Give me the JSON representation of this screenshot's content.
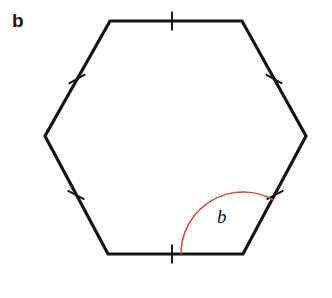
{
  "figure": {
    "part_label": "b",
    "angle_label": "b",
    "background_color": "#ffffff",
    "stroke_color": "#141414",
    "arc_color": "#c8503f",
    "shape_name": "hexagon",
    "stroke_width": 3.2,
    "tick_count": 6,
    "vertices": [
      {
        "name": "top-left",
        "x": 110,
        "y": 21
      },
      {
        "name": "top-right",
        "x": 242,
        "y": 21
      },
      {
        "name": "right",
        "x": 306,
        "y": 136
      },
      {
        "name": "bottom-right",
        "x": 243,
        "y": 254
      },
      {
        "name": "bottom-left",
        "x": 108,
        "y": 254
      },
      {
        "name": "left",
        "x": 45,
        "y": 136
      }
    ],
    "tick_marks": [
      {
        "name": "tick-top",
        "cx": 172,
        "cy": 21,
        "angle_deg": 0
      },
      {
        "name": "tick-upper-right",
        "cx": 274,
        "cy": 79,
        "angle_deg": 61
      },
      {
        "name": "tick-lower-right",
        "cx": 275,
        "cy": 195,
        "angle_deg": -62
      },
      {
        "name": "tick-bottom",
        "cx": 172,
        "cy": 254,
        "angle_deg": 0
      },
      {
        "name": "tick-lower-left",
        "cx": 76,
        "cy": 195,
        "angle_deg": 62
      },
      {
        "name": "tick-upper-left",
        "cx": 77,
        "cy": 79,
        "angle_deg": -61
      }
    ],
    "angle_arc": {
      "name": "interior-angle-arc",
      "vertex_x": 243,
      "vertex_y": 254,
      "radius": 62,
      "start_deg": 180,
      "end_deg": 61,
      "color": "#c8503f",
      "stroke_width": 1.6
    }
  }
}
